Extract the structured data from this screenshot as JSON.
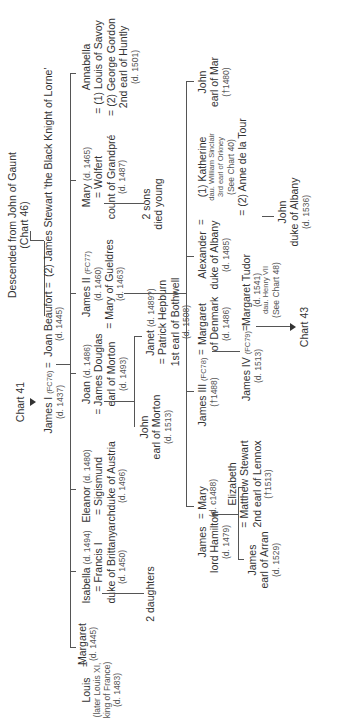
{
  "chart": {
    "orientation": "rotated 90° counter-clockwise",
    "header": {
      "ancestry_line1": "Descended from John of Gaunt",
      "ancestry_line2": "(Chart 46)",
      "from_chart": "Chart 41",
      "to_chart": "Chart 43"
    },
    "gen1": {
      "james1": {
        "name": "James I",
        "ref": "(FC76)",
        "dates": "(d. 1437)"
      },
      "joan_beaufort": {
        "name": "Joan Beaufort",
        "dates": "(d. 1445)"
      },
      "james_stewart": {
        "name": "(2) James Stewart 'the Black Knight of Lorne'"
      },
      "eq": "="
    },
    "gen2": {
      "margaret": {
        "name": "Margaret",
        "dates": "(d. 1445)"
      },
      "louis": {
        "name": "Louis",
        "line2": "(later Louis XI,",
        "line3": "king of France)",
        "dates": "(d. 1483)"
      },
      "isabella": {
        "name": "Isabella",
        "dates": "(d. 1494)",
        "spouse": "= Francis I",
        "spouse_line2": "duke of Brittany",
        "spouse_dates": "(d. 1450)",
        "issue": "2 daughters"
      },
      "eleanor": {
        "name": "Eleanor",
        "dates": "(d. 1480)",
        "spouse": "= Sigismund",
        "spouse_line2": "archduke of Austria",
        "spouse_dates": "(d. 1496)"
      },
      "joan": {
        "name": "Joan",
        "dates": "(d. 1486)",
        "spouse": "James Douglas",
        "spouse_line2": "earl of Morton",
        "spouse_dates": "(d. 1493)"
      },
      "james2": {
        "name": "James II",
        "ref": "(FC77)",
        "dates": "(d. 1460)",
        "spouse": "= Mary of Gueldres",
        "spouse_dates": "(d. 1463)"
      },
      "mary": {
        "name": "Mary",
        "dates": "(d. 1465)",
        "spouse": "Wolfert",
        "spouse_line2": "count of Grandpré",
        "spouse_dates": "(d. 1487)",
        "issue": "2 sons",
        "issue_line2": "died young"
      },
      "annabella": {
        "name": "Annabella",
        "spouse1": "= (1) Louis of Savoy",
        "spouse2": "= (2) George Gordon",
        "spouse2_line2": "2nd earl of Huntly",
        "spouse2_dates": "(d. 1501)"
      }
    },
    "gen3": {
      "john_morton": {
        "name": "John",
        "line2": "earl of Morton",
        "dates": "(d. 1513)"
      },
      "janet": {
        "name": "Janet",
        "dates": "(d. 1489?)",
        "spouse": "= Patrick Hepburn",
        "spouse_line2": "1st earl of Bothwell",
        "spouse_dates": "(d. 1508)"
      },
      "james_hamilton": {
        "name": "James",
        "line2": "lord Hamilton",
        "dates": "(d. 1479)"
      },
      "mary_c1488": {
        "name": "Mary",
        "dates": "(d. c1488)"
      },
      "james3": {
        "name": "James III",
        "ref": "(FC78)",
        "dates": "(†1488)"
      },
      "margaret_denmark": {
        "name": "Margaret",
        "line2": "of Denmark",
        "dates": "(d. 1486)"
      },
      "alexander": {
        "name": "Alexander",
        "line2": "duke of Albany",
        "dates": "(d. 1485)"
      },
      "katherine": {
        "name": "(1) Katherine",
        "line2": "dau. William Sinclair",
        "line3": "3rd earl of Orkney",
        "line4": "(See Chart 40)",
        "line5": "= (2) Anne de la Tour"
      },
      "john_mar": {
        "name": "John",
        "line2": "earl of Mar",
        "dates": "(†1480)"
      }
    },
    "gen4": {
      "james_arran": {
        "name": "James",
        "line2": "earl of Arran",
        "dates": "(d. 1529)"
      },
      "elizabeth": {
        "name": "Elizabeth",
        "spouse": "= Matthew Stewart",
        "spouse_line2": "2nd earl of Lennox",
        "spouse_dates": "(†1513)"
      },
      "james4": {
        "name": "James IV",
        "ref": "(FC79)",
        "dates": "(d. 1513)"
      },
      "margaret_tudor": {
        "name": "Margaret Tudor",
        "dates": "(d. 1541)",
        "line3": "dau. Henry VII",
        "line4": "(See Chart 48)"
      },
      "john_albany": {
        "name": "John",
        "line2": "duke of Albany",
        "dates": "(d. 1536)"
      }
    }
  }
}
